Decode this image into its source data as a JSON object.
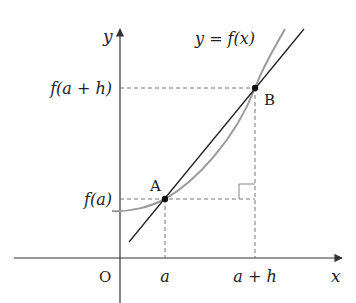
{
  "diagram": {
    "type": "secant-line-of-function",
    "curve_label": "y = f(x)",
    "axes": {
      "x_label": "x",
      "y_label": "y",
      "origin_label": "O"
    },
    "x_ticks": [
      "a",
      "a + h"
    ],
    "y_ticks": [
      "f(a + h)",
      "f(a)"
    ],
    "points": [
      {
        "name": "A",
        "x": "a",
        "y": "f(a)"
      },
      {
        "name": "B",
        "x": "a + h",
        "y": "f(a + h)"
      }
    ],
    "right_angle_marker": true,
    "colors": {
      "axis": "#333333",
      "secant": "#222222",
      "curve": "#9a9a9a",
      "dashed": "#555555",
      "point": "#111111"
    }
  }
}
